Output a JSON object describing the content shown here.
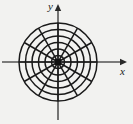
{
  "figure": {
    "background_color": "#f2f2f0",
    "stroke_color": "#1a1a1a",
    "axis_color": "#555555"
  },
  "axes": {
    "x_label": "x",
    "y_label": "y",
    "x_arrow_icon": "arrow-right-icon",
    "y_arrow_icon": "arrow-up-icon",
    "origin_marker_icon": "origin-dot-icon"
  },
  "chart_data": {
    "type": "line",
    "subtitle": "",
    "xlabel": "x",
    "ylabel": "y",
    "grid": true,
    "legend": null,
    "coordinate_system": "polar",
    "center": [
      58,
      62
    ],
    "circle_radii": [
      6.5,
      13,
      19.5,
      26,
      32.5,
      39
    ],
    "circle_count": 6,
    "radial_line_angles_deg": [
      0,
      30,
      60,
      90,
      120,
      150,
      180,
      210,
      240,
      270,
      300,
      330
    ],
    "radial_line_count": 12,
    "radial_spacing_deg": 30,
    "radial_line_length": 39,
    "xlim": [
      -58,
      75
    ],
    "ylim": [
      -62,
      62
    ],
    "x_axis_y": 62,
    "y_axis_x": 58,
    "x_axis_extent": [
      2,
      124
    ],
    "y_axis_extent": [
      8,
      120
    ],
    "origin_dot_radius": 3
  }
}
